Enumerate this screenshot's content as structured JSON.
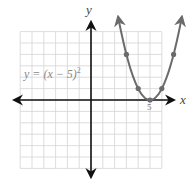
{
  "chart_data": {
    "type": "line",
    "title": "",
    "equation_label": "y = (x − 5)",
    "equation_exponent": "2",
    "xlabel": "x",
    "ylabel": "y",
    "xlim": [
      -6,
      6
    ],
    "ylim": [
      -6,
      6
    ],
    "grid": true,
    "grid_step": 1,
    "tick_labels": [
      {
        "x": 5,
        "label": "5"
      }
    ],
    "series": [
      {
        "name": "y = (x - 5)^2",
        "function": "(x-5)^2",
        "domain": [
          2.3,
          7.7
        ],
        "points": [
          {
            "x": 3,
            "y": 4
          },
          {
            "x": 4,
            "y": 1
          },
          {
            "x": 5,
            "y": 0
          },
          {
            "x": 6,
            "y": 1
          },
          {
            "x": 7,
            "y": 4
          }
        ],
        "color": "#6b6b6b",
        "arrows_at_ends": true
      }
    ],
    "axis_color": "#111111",
    "grid_color": "#d4d4d4",
    "label_color": "#8a8a8a"
  }
}
